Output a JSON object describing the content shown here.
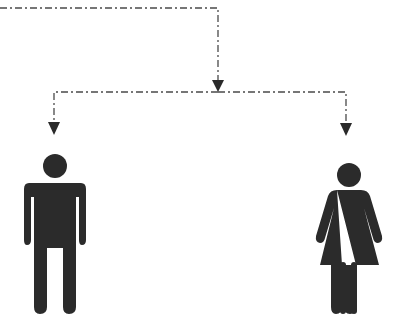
{
  "diagram": {
    "type": "hierarchy-split",
    "colors": {
      "background": "#ffffff",
      "line": "#4a4a4a",
      "arrow": "#2a2a2a",
      "figure": "#2b2b2b"
    },
    "connectors": [
      {
        "id": "top-feed",
        "style": "dash-dot",
        "from": "left-edge",
        "to": "junction"
      },
      {
        "id": "branch-left",
        "style": "dash-dot",
        "from": "junction",
        "to": "man"
      },
      {
        "id": "branch-right",
        "style": "dash-dot",
        "from": "junction",
        "to": "woman"
      }
    ],
    "nodes": [
      {
        "id": "man",
        "icon": "man-icon",
        "position": "bottom-left"
      },
      {
        "id": "woman",
        "icon": "woman-icon",
        "position": "bottom-right"
      }
    ]
  }
}
